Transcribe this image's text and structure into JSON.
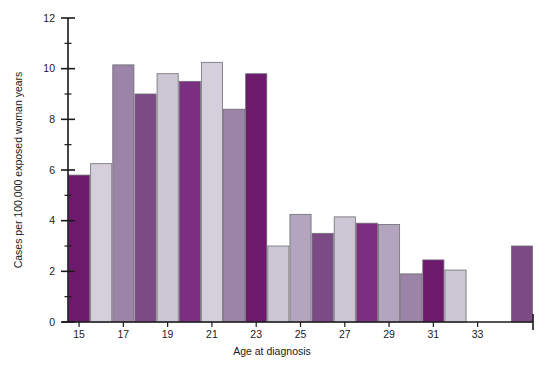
{
  "chart_data": {
    "type": "bar",
    "title": "",
    "xlabel": "Age at diagnosis",
    "ylabel": "Cases per 100,000 exposed woman years",
    "xlim": [
      14.4,
      35.8
    ],
    "ylim": [
      0,
      12
    ],
    "y_major_ticks": [
      0,
      2,
      4,
      6,
      8,
      10,
      12
    ],
    "y_minor_ticks": [
      1,
      3,
      5,
      7,
      9,
      11
    ],
    "y_tick_labels": [
      "0",
      "2",
      "4",
      "6",
      "8",
      "10",
      "12"
    ],
    "x_tick_labels": [
      "15",
      "17",
      "19",
      "21",
      "23",
      "25",
      "27",
      "29",
      "31",
      "33"
    ],
    "x_tick_values": [
      15,
      17,
      19,
      21,
      23,
      25,
      27,
      29,
      31,
      33
    ],
    "grid": false,
    "legend": "none",
    "categories": [
      15,
      16,
      17,
      18,
      19,
      20,
      21,
      22,
      23,
      24,
      25,
      26,
      27,
      28,
      29,
      30,
      31,
      32,
      33,
      34,
      35
    ],
    "values": [
      5.8,
      6.25,
      10.15,
      9.0,
      9.8,
      9.5,
      10.25,
      8.4,
      9.8,
      3.0,
      4.25,
      3.5,
      4.15,
      3.9,
      3.85,
      1.9,
      2.45,
      2.05,
      0.0,
      0.0,
      3.0
    ],
    "bar_colors": [
      "#6d1a6d",
      "#d4cfda",
      "#9b84a8",
      "#7c4a85",
      "#cdc6d4",
      "#7c2f80",
      "#d4cfda",
      "#9b84a8",
      "#6d1a6d",
      "#cdc6d4",
      "#b3a5bd",
      "#7c4a85",
      "#cdc6d4",
      "#7c2f80",
      "#b3a5bd",
      "#9b84a8",
      "#6d1a6d",
      "#cdc6d4",
      "#ffffff",
      "#ffffff",
      "#7c4a85"
    ],
    "palette": {
      "dark_purple": "#6d1a6d",
      "mid_purple": "#7c4a85",
      "mauve": "#9b84a8",
      "light_mauve": "#b3a5bd",
      "lavender": "#cdc6d4",
      "pale_lavender": "#d4cfda",
      "axis": "#1a1a1a",
      "bar_outline": "#6d6d74",
      "background": "#ffffff"
    }
  }
}
